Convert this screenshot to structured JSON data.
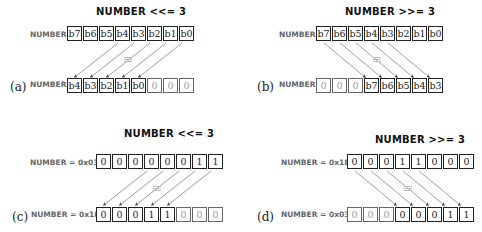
{
  "panels": [
    {
      "id": "a",
      "letter": "(a)",
      "title": "NUMBER <<= 3",
      "top_label": "NUMBER",
      "bottom_label": "NUMBER",
      "top_cells": [
        "b7",
        "b6",
        "b5",
        "b4",
        "b3",
        "b2",
        "b1",
        "b0"
      ],
      "bottom_cells": [
        "b4",
        "b3",
        "b2",
        "b1",
        "b0",
        "0",
        "0",
        "0"
      ],
      "bottom_fill": [
        false,
        false,
        false,
        false,
        false,
        true,
        true,
        true
      ],
      "direction": "left"
    },
    {
      "id": "b",
      "letter": "(b)",
      "title": "NUMBER >>= 3",
      "top_label": "NUMBER",
      "bottom_label": "NUMBER",
      "top_cells": [
        "b7",
        "b6",
        "b5",
        "b4",
        "b3",
        "b2",
        "b1",
        "b0"
      ],
      "bottom_cells": [
        "0",
        "0",
        "0",
        "b7",
        "b6",
        "b5",
        "b4",
        "b3"
      ],
      "bottom_fill": [
        true,
        true,
        true,
        false,
        false,
        false,
        false,
        false
      ],
      "direction": "right"
    },
    {
      "id": "c",
      "letter": "(c)",
      "title": "NUMBER <<= 3",
      "top_label": "NUMBER = 0x03",
      "bottom_label": "NUMBER = 0x18",
      "top_cells": [
        "0",
        "0",
        "0",
        "0",
        "0",
        "0",
        "1",
        "1"
      ],
      "bottom_cells": [
        "0",
        "0",
        "0",
        "1",
        "1",
        "0",
        "0",
        "0"
      ],
      "bottom_fill": [
        false,
        false,
        false,
        false,
        false,
        true,
        true,
        true
      ],
      "direction": "left"
    },
    {
      "id": "d",
      "letter": "(d)",
      "title": "NUMBER >>= 3",
      "top_label": "NUMBER = 0x18",
      "bottom_label": "NUMBER = 0x03",
      "top_cells": [
        "0",
        "0",
        "0",
        "1",
        "1",
        "0",
        "0",
        "0"
      ],
      "bottom_cells": [
        "0",
        "0",
        "0",
        "0",
        "0",
        "0",
        "1",
        "1"
      ],
      "bottom_fill": [
        true,
        true,
        true,
        false,
        false,
        false,
        false,
        false
      ],
      "direction": "right"
    }
  ]
}
